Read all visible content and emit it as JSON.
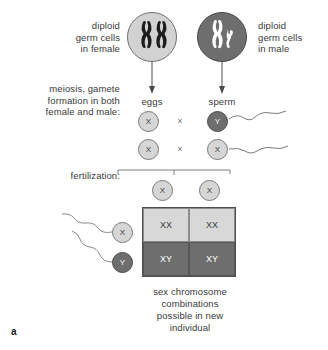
{
  "figure": {
    "panel_letter": "a",
    "caption": "sex chromosome\ncombinations\npossible in new\nindividual"
  },
  "labels": {
    "female_germ": "diploid\ngerm cells\nin female",
    "male_germ": "diploid\ngerm cells\nin male",
    "meiosis": "meiosis, gamete\nformation in both\nfemale and male:",
    "fertilization": "fertilization:",
    "eggs": "eggs",
    "sperm": "sperm"
  },
  "germ_cells": {
    "female": {
      "chromosomes": "XX",
      "fill": "#d2d2d2",
      "chromosome_color": "#1c1c1c"
    },
    "male": {
      "chromosomes": "XY",
      "fill": "#6e6e6e",
      "chromosome_color": "#ffffff"
    }
  },
  "gametes": {
    "cross_symbol": "×",
    "rows": [
      {
        "egg": "X",
        "sperm": "Y"
      },
      {
        "egg": "X",
        "sperm": "X"
      }
    ]
  },
  "punnett": {
    "top_gametes": [
      "X",
      "X"
    ],
    "side_gametes": [
      "X",
      "Y"
    ],
    "cells": [
      {
        "value": "XX",
        "style": "light"
      },
      {
        "value": "XX",
        "style": "light"
      },
      {
        "value": "XY",
        "style": "dark"
      },
      {
        "value": "XY",
        "style": "dark"
      }
    ]
  },
  "colors": {
    "light_cell": "#d2d2d2",
    "dark_cell": "#6e6e6e",
    "outline": "#4e4e4e",
    "text": "#3a3a3a"
  }
}
